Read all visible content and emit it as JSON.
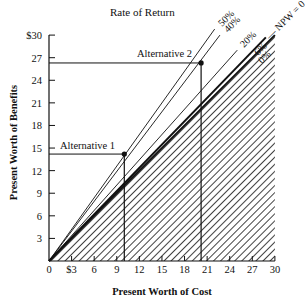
{
  "chart_data": {
    "type": "line",
    "title": "Rate of Return",
    "xlabel": "Present Worth of Cost",
    "ylabel": "Present Worth of Benefits",
    "xlim": [
      0,
      30
    ],
    "ylim": [
      0,
      30
    ],
    "x_ticks": [
      "0",
      "$3",
      "6",
      "9",
      "12",
      "15",
      "18",
      "21",
      "24",
      "27",
      "30"
    ],
    "y_ticks": [
      "0",
      "3",
      "6",
      "9",
      "12",
      "15",
      "18",
      "21",
      "24",
      "27",
      "$30"
    ],
    "grid": false,
    "series": [
      {
        "name": "50%",
        "slope": 1.4,
        "x": [
          0,
          22
        ],
        "y": [
          0,
          30.8
        ]
      },
      {
        "name": "40%",
        "slope": 1.32,
        "x": [
          0,
          22.7
        ],
        "y": [
          0,
          30
        ]
      },
      {
        "name": "20%",
        "slope": 1.12,
        "x": [
          0,
          25
        ],
        "y": [
          0,
          28
        ]
      },
      {
        "name": "6%",
        "slope": 1.03,
        "x": [
          0,
          28.8
        ],
        "y": [
          0,
          29.7
        ]
      },
      {
        "name": "0% — NPW = 0",
        "slope": 1.0,
        "x": [
          0,
          30
        ],
        "y": [
          0,
          30
        ]
      }
    ],
    "points": [
      {
        "label": "Alternative 1",
        "x": 10,
        "y": 14.2
      },
      {
        "label": "Alternative 2",
        "x": 20.2,
        "y": 26.3
      }
    ],
    "shaded_region": "area below NPW = 0 line (benefits < cost), hatched",
    "annotations": [
      "50%",
      "40%",
      "20%",
      "6%",
      "0%",
      "NPW = 0"
    ]
  },
  "labels": {
    "title": "Rate of Return",
    "xlabel": "Present Worth of Cost",
    "ylabel": "Present Worth of Benefits",
    "alt1": "Alternative 1",
    "alt2": "Alternative 2",
    "r50": "50%",
    "r40": "40%",
    "r20": "20%",
    "r6": "6%",
    "r0": "0%",
    "npw": "— NPW = 0"
  }
}
